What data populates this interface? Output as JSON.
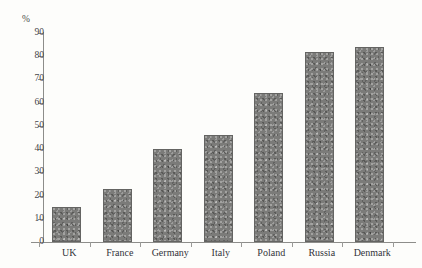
{
  "figure": {
    "caption_remnant": "",
    "background_color": "#fdfdfb",
    "bar_color": "#7b7b79",
    "axis_color": "#8d8d8a"
  },
  "chart_data": {
    "type": "bar",
    "title": "",
    "xlabel": "",
    "ylabel": "%",
    "ylim": [
      0,
      90
    ],
    "yticks": [
      0,
      10,
      20,
      30,
      40,
      50,
      60,
      70,
      80,
      90
    ],
    "ytick_labels": [
      "0",
      "10",
      "20",
      "30",
      "40",
      "50",
      "60",
      "70",
      "80",
      "90"
    ],
    "grid": false,
    "legend": "none",
    "categories": [
      "UK",
      "France",
      "Germany",
      "Italy",
      "Poland",
      "Russia",
      "Denmark"
    ],
    "values": [
      15,
      23,
      40,
      46,
      64,
      82,
      84
    ]
  }
}
